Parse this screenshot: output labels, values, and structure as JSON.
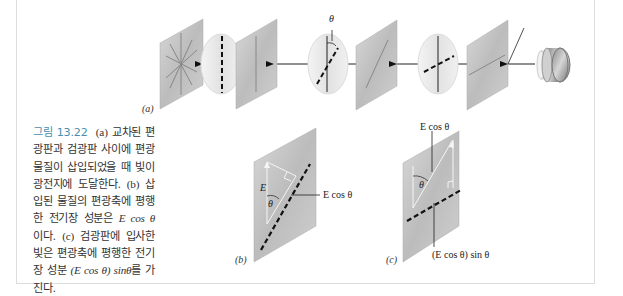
{
  "figure": {
    "number_label": "그림 13.22",
    "caption_parts": {
      "a_marker": "(a)",
      "a_text": "교차된 편광판과 검광판 사이에 편광 물질이 삽입되었을 때 빛이 광전지에 도달한다.",
      "b_marker": "(b)",
      "b_text_pre": "삽입된 물질의 편광축에 평행한 전기장 성분은",
      "b_math": "E cos θ",
      "b_text_post": "이다.",
      "c_marker": "(c)",
      "c_text_pre": "검광판에 입사한 빛은 편광축에 평행한 전기장 성분",
      "c_math": "(E cos θ) sinθ",
      "c_text_post": "를 가진다."
    },
    "panels": {
      "a": {
        "label": "(a)",
        "theta_label": "θ",
        "components": [
          "unpolarized-source-plate",
          "polarizer-vertical",
          "sample-disc",
          "polarizer-rotated",
          "analyzer-disc-rotated",
          "analyzer-plate-horizontal",
          "photocell"
        ]
      },
      "b": {
        "label": "(b)",
        "e_label": "E",
        "theta_label": "θ",
        "component_label": "E cos θ"
      },
      "c": {
        "label": "(c)",
        "top_label": "E cos θ",
        "theta_label": "θ",
        "component_label": "(E cos θ) sin θ"
      }
    },
    "colors": {
      "caption_label": "#4a8fb0",
      "plate_fill": "#c4c4c4",
      "disc_fill": "#e8e8e8",
      "line": "#222222"
    }
  }
}
